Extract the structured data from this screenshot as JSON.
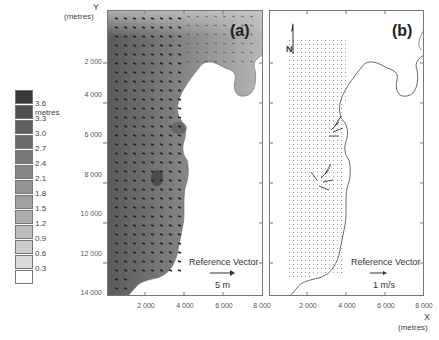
{
  "axes": {
    "y_title": "Y",
    "y_unit": "(metres)",
    "x_title": "X",
    "x_unit": "(metres)",
    "y_ticks": [
      "2 000",
      "4 000",
      "6 000",
      "8 000",
      "10 000",
      "12 000",
      "14 000"
    ],
    "x_ticks_a": [
      "2 000",
      "4 000",
      "6 000",
      "8 000"
    ],
    "x_ticks_b": [
      "2 000",
      "4 000",
      "6 000",
      "8 000"
    ]
  },
  "legend": {
    "unit": "metres",
    "items": [
      {
        "label": "3.6 metres",
        "color": "#3a3a3a"
      },
      {
        "label": "3.3",
        "color": "#505050"
      },
      {
        "label": "3.0",
        "color": "#5e5e5e"
      },
      {
        "label": "2.7",
        "color": "#6b6b6b"
      },
      {
        "label": "2.4",
        "color": "#787878"
      },
      {
        "label": "2.1",
        "color": "#858585"
      },
      {
        "label": "1.8",
        "color": "#929292"
      },
      {
        "label": "1.5",
        "color": "#a0a0a0"
      },
      {
        "label": "1.2",
        "color": "#adadad"
      },
      {
        "label": "0.9",
        "color": "#bcbcbc"
      },
      {
        "label": "0.6",
        "color": "#cbcbcb"
      },
      {
        "label": "0.3",
        "color": "#dadada"
      },
      {
        "label": "",
        "color": "#ffffff"
      }
    ]
  },
  "panel_a": {
    "label": "(a)",
    "ref_title": "Reference Vector",
    "ref_value": "5 m"
  },
  "panel_b": {
    "label": "(b)",
    "north_label": "N",
    "ref_title": "Reference Vector",
    "ref_value": "1 m/s"
  }
}
